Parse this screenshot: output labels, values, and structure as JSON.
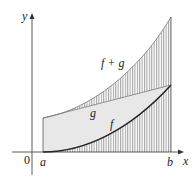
{
  "diagram": {
    "axes": {
      "x_label": "x",
      "y_label": "y",
      "origin_label": "0"
    },
    "points": {
      "a_label": "a",
      "b_label": "b"
    },
    "curves": {
      "f_label": "f",
      "g_label": "g",
      "sum_label": "f + g"
    },
    "colors": {
      "axis": "#333333",
      "hatch": "#555555",
      "fill_g": "#e6e6e6",
      "curve_f": "#222222"
    }
  }
}
